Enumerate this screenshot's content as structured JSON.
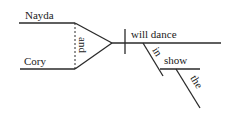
{
  "diagram": {
    "type": "sentence-diagram",
    "subjects": [
      "Nayda",
      "Cory"
    ],
    "conjunction": "and",
    "predicate": "will dance",
    "preposition": "in",
    "prepositional_object": "show",
    "article": "the",
    "colors": {
      "line": "#2a2a2a",
      "text": "#222222",
      "background": "#ffffff"
    }
  }
}
